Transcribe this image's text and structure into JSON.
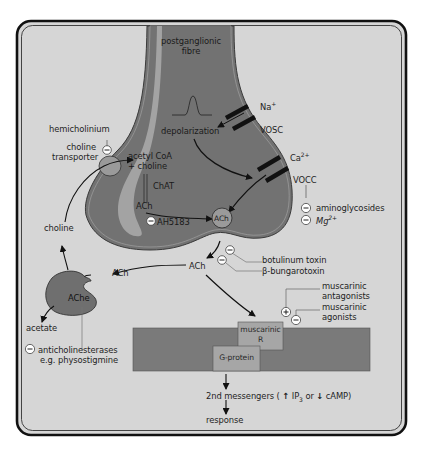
{
  "diagram": {
    "colors": {
      "background": "#d6d6d6",
      "terminal_fill": "#727272",
      "terminal_inner_band": "#a3a3a3",
      "membrane_fill": "#7a7a7a",
      "receptor_fill": "#a6a6a6",
      "border": "#1a1a1a",
      "inhibitor_circle": "#ffffff"
    },
    "structures": {
      "fibre_label_line1": "postganglionic",
      "fibre_label_line2": "fibre",
      "depolarization": "depolarization",
      "na_ion": "Na",
      "na_charge": "+",
      "vosc": "VOSC",
      "ca_ion": "Ca",
      "ca_charge": "2+",
      "vocc": "VOCC",
      "choline_transporter_line1": "choline",
      "choline_transporter_line2": "transporter",
      "acetyl_coa_line1": "acetyl CoA",
      "acetyl_coa_line2": "+ choline",
      "chat": "ChAT",
      "ach_synth": "ACh",
      "ach_vesicle": "ACh",
      "ach_cleft": "ACh",
      "ach_to_enzyme": "ACh",
      "enzyme": "AChe",
      "choline": "choline",
      "acetate": "acetate",
      "receptor_line1": "muscarinic",
      "receptor_line2": "R",
      "g_protein": "G-protein"
    },
    "modulators": {
      "hemicholinium": {
        "label": "hemicholinium",
        "sign": "−"
      },
      "ah5183": {
        "label": "AH5183",
        "sign": "−"
      },
      "aminoglycosides": {
        "label": "aminoglycosides",
        "sign": "−"
      },
      "mg": {
        "label": "Mg",
        "charge": "2+",
        "sign": "−"
      },
      "botulinum": {
        "label": "botulinum toxin",
        "sign": "−"
      },
      "bungarotoxin": {
        "label": "β-bungarotoxin",
        "sign": "−"
      },
      "muscarinic_antagonists": {
        "line1": "muscarinic",
        "line2": "antagonists",
        "sign": "+"
      },
      "muscarinic_agonists": {
        "line1": "muscarinic",
        "line2": "agonists",
        "sign": "−"
      },
      "anticholinesterases": {
        "line1": "anticholinesterases",
        "line2": "e.g. physostigmine",
        "sign": "−"
      }
    },
    "cascade": {
      "second_messengers_prefix": "2nd messengers (",
      "up_arrow": "↑",
      "ip3": "IP",
      "ip3_sub": "3",
      "or": "or",
      "down_arrow": "↓",
      "camp": "cAMP)",
      "response": "response"
    }
  }
}
